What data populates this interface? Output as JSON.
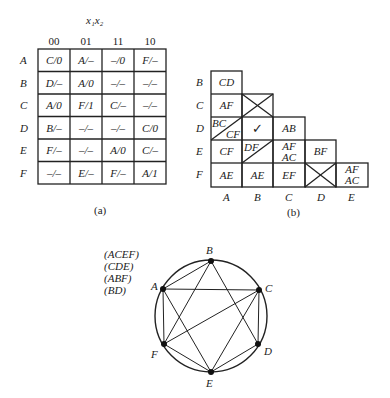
{
  "flow_table": {
    "variable_label": "x₁x₂",
    "columns": [
      "00",
      "01",
      "11",
      "10"
    ],
    "rows": [
      {
        "state": "A",
        "cells": [
          "C/0",
          "A/–",
          "–/0",
          "F/–"
        ]
      },
      {
        "state": "B",
        "cells": [
          "D/–",
          "A/0",
          "–/–",
          "–/–"
        ]
      },
      {
        "state": "C",
        "cells": [
          "A/0",
          "F/1",
          "C/–",
          "–/–"
        ]
      },
      {
        "state": "D",
        "cells": [
          "B/–",
          "–/–",
          "–/–",
          "C/0"
        ]
      },
      {
        "state": "E",
        "cells": [
          "F/–",
          "–/–",
          "A/0",
          "C/–"
        ]
      },
      {
        "state": "F",
        "cells": [
          "–/–",
          "E/–",
          "F/–",
          "A/1"
        ]
      }
    ],
    "caption": "(a)"
  },
  "implication_table": {
    "row_labels": [
      "B",
      "C",
      "D",
      "E",
      "F"
    ],
    "col_labels": [
      "A",
      "B",
      "C",
      "D",
      "E"
    ],
    "cells": {
      "BA": "CD",
      "CA": "AF",
      "CB": "X",
      "DA_top": "BC",
      "DA_bottom": "CF",
      "DB": "✓",
      "DC": "AB",
      "EA": "CF",
      "EB": "DF",
      "EC_top": "AF",
      "EC_bottom": "AC",
      "ED": "BF",
      "FA": "AE",
      "FB": "AE",
      "FC": "EF",
      "FD": "X",
      "FE_top": "AF",
      "FE_bottom": "AC"
    },
    "caption": "(b)"
  },
  "compatibility_graph": {
    "maximal_compatibles": [
      "(ACEF)",
      "(CDE)",
      "(ABF)",
      "(BD)"
    ],
    "nodes": [
      {
        "id": "A",
        "x": 163,
        "y": 289
      },
      {
        "id": "B",
        "x": 211,
        "y": 261
      },
      {
        "id": "C",
        "x": 259,
        "y": 290
      },
      {
        "id": "D",
        "x": 258,
        "y": 344
      },
      {
        "id": "E",
        "x": 211,
        "y": 372
      },
      {
        "id": "F",
        "x": 164,
        "y": 344
      }
    ],
    "edges": [
      [
        "A",
        "B"
      ],
      [
        "A",
        "C"
      ],
      [
        "A",
        "F"
      ],
      [
        "A",
        "E"
      ],
      [
        "B",
        "F"
      ],
      [
        "B",
        "D"
      ],
      [
        "C",
        "F"
      ],
      [
        "C",
        "D"
      ],
      [
        "C",
        "E"
      ],
      [
        "F",
        "E"
      ],
      [
        "E",
        "D"
      ]
    ]
  }
}
